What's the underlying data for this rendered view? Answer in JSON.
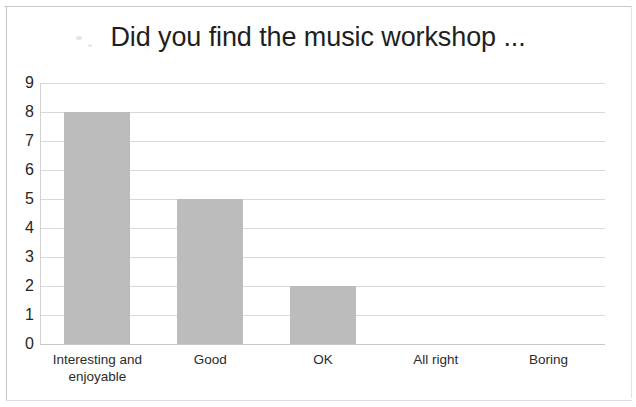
{
  "chart_data": {
    "type": "bar",
    "title": "Did you find the music workshop ...",
    "xlabel": "",
    "ylabel": "",
    "categories": [
      "Interesting and enjoyable",
      "Good",
      "OK",
      "All right",
      "Boring"
    ],
    "values": [
      8,
      5,
      2,
      0,
      0
    ],
    "ylim": [
      0,
      9
    ],
    "ytick_labels": [
      "9",
      "8",
      "7",
      "6",
      "5",
      "4",
      "3",
      "2",
      "1",
      "0"
    ],
    "ytick_values": [
      9,
      8,
      7,
      6,
      5,
      4,
      3,
      2,
      1,
      0
    ],
    "grid": true,
    "legend": false,
    "bar_color": "#bcbcbc",
    "gridline_color": "#d9d9d9",
    "title_color": "#1f1f1f",
    "background_color": "#ffffff"
  }
}
